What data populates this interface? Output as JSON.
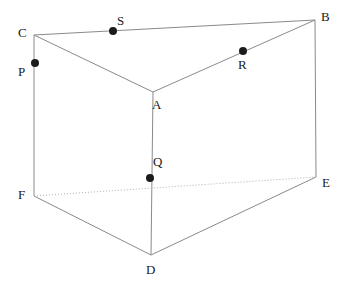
{
  "figure": {
    "background_color": "#ffffff",
    "edge_color": "#8a8a8a",
    "hidden_edge_color": "#b0b0b0",
    "dot_color": "#1b1b1b",
    "label_color": "#1a1a1a",
    "vertices": [
      {
        "id": "A",
        "label": "A",
        "x": 153,
        "y": 92,
        "label_x": 152,
        "label_y": 98
      },
      {
        "id": "B",
        "label": "B",
        "x": 315,
        "y": 20,
        "label_x": 321,
        "label_y": 10
      },
      {
        "id": "C",
        "label": "C",
        "x": 34,
        "y": 35,
        "label_x": 18,
        "label_y": 26
      },
      {
        "id": "D",
        "label": "D",
        "x": 151,
        "y": 255,
        "label_x": 146,
        "label_y": 263
      },
      {
        "id": "E",
        "label": "E",
        "x": 316,
        "y": 177,
        "label_x": 322,
        "label_y": 176
      },
      {
        "id": "F",
        "label": "F",
        "x": 34,
        "y": 196,
        "label_x": 18,
        "label_y": 188
      }
    ],
    "marked_points": [
      {
        "id": "P",
        "label": "P",
        "x": 35,
        "y": 63,
        "on_edge": "C-F",
        "label_x": 18,
        "label_y": 65,
        "radius": 4
      },
      {
        "id": "Q",
        "label": "Q",
        "x": 150,
        "y": 178,
        "on_edge": "A-D",
        "label_x": 153,
        "label_y": 155,
        "radius": 4
      },
      {
        "id": "R",
        "label": "R",
        "x": 243,
        "y": 51,
        "on_edge": "A-B",
        "label_x": 238,
        "label_y": 58,
        "radius": 4
      },
      {
        "id": "S",
        "label": "S",
        "x": 113,
        "y": 31,
        "on_edge": "C-B",
        "label_x": 117,
        "label_y": 14,
        "radius": 4
      }
    ],
    "edges": [
      {
        "id": "C-B",
        "from": "C",
        "to": "B",
        "style": "solid"
      },
      {
        "id": "C-A",
        "from": "C",
        "to": "A",
        "style": "solid"
      },
      {
        "id": "A-B",
        "from": "A",
        "to": "B",
        "style": "solid"
      },
      {
        "id": "C-F",
        "from": "C",
        "to": "F",
        "style": "solid"
      },
      {
        "id": "A-D",
        "from": "A",
        "to": "D",
        "style": "solid"
      },
      {
        "id": "B-E",
        "from": "B",
        "to": "E",
        "style": "solid"
      },
      {
        "id": "F-D",
        "from": "F",
        "to": "D",
        "style": "solid"
      },
      {
        "id": "D-E",
        "from": "D",
        "to": "E",
        "style": "solid"
      },
      {
        "id": "F-E",
        "from": "F",
        "to": "E",
        "style": "dotted"
      }
    ]
  }
}
